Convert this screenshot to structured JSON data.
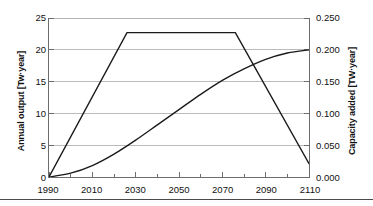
{
  "chart_data": {
    "type": "line",
    "title": "",
    "xlabel": "",
    "ylabel": "Annual output [Tw·year]",
    "y2label": "Capacity added [TW·year]",
    "xlim": [
      1990,
      2110
    ],
    "ylim": [
      0,
      25
    ],
    "y2lim": [
      0.0,
      0.25
    ],
    "grid": true,
    "legend": "none",
    "x_ticks": [
      1990,
      2010,
      2030,
      2050,
      2070,
      2090,
      2110
    ],
    "x_tick_labels": [
      "1990",
      "2010",
      "2030",
      "2050",
      "2070",
      "2090",
      "2110"
    ],
    "x_minor_tick_step": 10,
    "y_ticks": [
      0,
      5,
      10,
      15,
      20,
      25
    ],
    "y_tick_labels": [
      "0",
      "5",
      "10",
      "15",
      "20",
      "25"
    ],
    "y2_ticks": [
      0.0,
      0.05,
      0.1,
      0.15,
      0.2,
      0.25
    ],
    "y2_tick_labels": [
      "0.000",
      "0.050",
      "0.100",
      "0.150",
      "0.200",
      "0.250"
    ],
    "series": [
      {
        "name": "Capacity added",
        "axis": "right",
        "color": "#1a1a1a",
        "shape": "trapezoid",
        "x": [
          1990,
          2026,
          2076,
          2110
        ],
        "values": [
          0.0,
          0.227,
          0.227,
          0.021
        ],
        "values_left_axis": [
          0,
          22.7,
          22.7,
          2.1
        ]
      },
      {
        "name": "Annual output",
        "axis": "left",
        "color": "#1a1a1a",
        "shape": "s-curve",
        "x": [
          1990,
          2000,
          2010,
          2020,
          2030,
          2040,
          2050,
          2060,
          2070,
          2080,
          2090,
          2100,
          2110
        ],
        "values": [
          0.0,
          0.6,
          1.8,
          3.6,
          5.8,
          8.2,
          10.6,
          13.0,
          15.2,
          17.0,
          18.5,
          19.5,
          20.0
        ],
        "values_right_axis": [
          0.0,
          0.006,
          0.018,
          0.036,
          0.058,
          0.082,
          0.106,
          0.13,
          0.152,
          0.17,
          0.185,
          0.195,
          0.2
        ]
      }
    ],
    "colors": {
      "curve": "#1a1a1a",
      "grid": "#b3b3b3",
      "axis": "#6d6d6d",
      "text": "#111111",
      "background": "#ffffff"
    }
  }
}
